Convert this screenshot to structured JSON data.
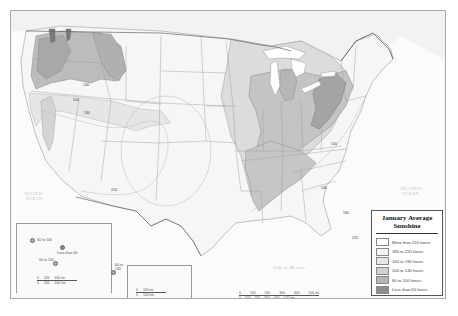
{
  "map": {
    "title": "January Average Sunshine",
    "title_lines": [
      "January Average",
      "Sunshine"
    ],
    "region": "Contiguous United States with Alaska and Hawaii insets"
  },
  "legend": {
    "title_line1": "January Average",
    "title_line2": "Sunshine",
    "items": [
      {
        "label": "More than 220 hours",
        "color": "#ffffff"
      },
      {
        "label": "180 to 220 hours",
        "color": "#f4f4f4"
      },
      {
        "label": "140 to 180 hours",
        "color": "#e6e6e6"
      },
      {
        "label": "100 to 140 hours",
        "color": "#d0d0d0"
      },
      {
        "label": "60 to 100 hours",
        "color": "#b4b4b4"
      },
      {
        "label": "Less than 60 hours",
        "color": "#8e8e8e"
      }
    ]
  },
  "ocean_labels": {
    "pacific": [
      "PACIFIC",
      "OCEAN"
    ],
    "atlantic": [
      "ATLANTIC",
      "OCEAN"
    ],
    "gulf": "Gulf of Mexico"
  },
  "isoline_labels": [
    "100",
    "140",
    "180",
    "220",
    "140",
    "100",
    "140",
    "180",
    "220"
  ],
  "alaska": {
    "labels": [
      "60 to 100",
      "Less than 60",
      "60 to 100",
      "60 to 100"
    ],
    "scale_top": [
      "0",
      "200",
      "400 mi"
    ],
    "scale_bottom": [
      "0",
      "200",
      "400 km"
    ]
  },
  "hawaii": {
    "scale_top": [
      "0",
      "100 mi"
    ],
    "scale_bottom": [
      "0",
      "100 km"
    ]
  },
  "main_scale": {
    "miles": [
      "0",
      "100",
      "200",
      "300",
      "400",
      "500 mi"
    ],
    "km": [
      "0",
      "100",
      "200",
      "300",
      "400",
      "500 km"
    ]
  }
}
